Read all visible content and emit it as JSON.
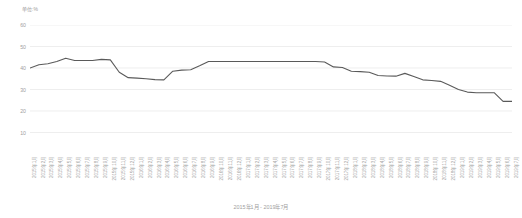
{
  "chart_data": {
    "type": "line",
    "title": "",
    "subtitle": "",
    "caption": "2015年1月 - 2019年7月",
    "ylabel": "单位:%",
    "xlabel": "",
    "ylim": [
      0,
      60
    ],
    "yticks": [
      10,
      20,
      30,
      40,
      50,
      60
    ],
    "ytick_labels": [
      "10",
      "20",
      "30",
      "40",
      "50",
      "60"
    ],
    "grid": true,
    "legend": "none",
    "line_color": "#5a5a5a",
    "grid_color": "#e6e6e6",
    "categories": [
      "2015年1月",
      "2015年2月",
      "2015年3月",
      "2015年4月",
      "2015年5月",
      "2015年6月",
      "2015年7月",
      "2015年8月",
      "2015年9月",
      "2015年10月",
      "2015年11月",
      "2015年12月",
      "2016年1月",
      "2016年2月",
      "2016年3月",
      "2016年4月",
      "2016年5月",
      "2016年6月",
      "2016年7月",
      "2016年8月",
      "2016年9月",
      "2016年10月",
      "2016年11月",
      "2016年12月",
      "2017年1月",
      "2017年2月",
      "2017年3月",
      "2017年4月",
      "2017年5月",
      "2017年6月",
      "2017年7月",
      "2017年8月",
      "2017年9月",
      "2017年10月",
      "2017年11月",
      "2017年12月",
      "2018年1月",
      "2018年2月",
      "2018年3月",
      "2018年4月",
      "2018年5月",
      "2018年6月",
      "2018年7月",
      "2018年8月",
      "2018年9月",
      "2018年10月",
      "2018年11月",
      "2018年12月",
      "2019年1月",
      "2019年2月",
      "2019年3月",
      "2019年4月",
      "2019年5月",
      "2019年6月",
      "2019年7月"
    ],
    "series": [
      {
        "name": "利率",
        "values": [
          40.0,
          41.5,
          42.0,
          43.0,
          44.5,
          43.5,
          43.5,
          43.5,
          44.0,
          43.8,
          38.0,
          35.5,
          35.3,
          35.0,
          34.6,
          34.5,
          38.5,
          39.0,
          39.2,
          41.0,
          43.0,
          43.0,
          43.0,
          43.0,
          43.0,
          43.0,
          43.0,
          43.0,
          43.0,
          43.0,
          43.0,
          43.0,
          43.0,
          42.8,
          40.5,
          40.2,
          38.5,
          38.3,
          38.0,
          36.5,
          36.3,
          36.2,
          37.5,
          36.0,
          34.5,
          34.2,
          33.8,
          32.0,
          30.0,
          28.8,
          28.5,
          28.5,
          28.5,
          24.5,
          24.5
        ]
      }
    ]
  }
}
